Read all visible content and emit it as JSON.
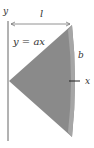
{
  "diagram": {
    "labels": {
      "y_axis": "y",
      "length": "l",
      "equation": "y = ax",
      "radius": "b",
      "x_axis": "x"
    },
    "colors": {
      "fill": "#8a8a8a",
      "edge_band": "#a8a8a8",
      "axis": "#555555",
      "text": "#333333"
    }
  }
}
